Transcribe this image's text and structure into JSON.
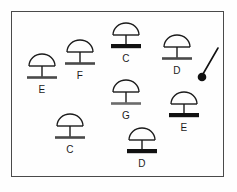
{
  "diagram": {
    "background_color": "#fefefe",
    "frame_color": "#4a4a4a",
    "stroke_color": "#1b1b1b",
    "frame": {
      "x": 11,
      "y": 11,
      "width": 213,
      "height": 166
    },
    "symbols": [
      {
        "id": "symbol-e-left",
        "label": "E",
        "x": 20,
        "y": 50,
        "base_weight": "medium",
        "base_color": "#4a4a4a",
        "label_x": 20,
        "label_y": 84
      },
      {
        "id": "symbol-f",
        "label": "F",
        "x": 58,
        "y": 36,
        "base_weight": "medium",
        "base_color": "#4a4a4a",
        "label_x": 58,
        "label_y": 70
      },
      {
        "id": "symbol-c-top",
        "label": "C",
        "x": 104,
        "y": 19,
        "base_weight": "thick",
        "base_color": "#111111",
        "label_x": 104,
        "label_y": 53
      },
      {
        "id": "symbol-d-right",
        "label": "D",
        "x": 155,
        "y": 31,
        "base_weight": "medium",
        "base_color": "#4a4a4a",
        "label_x": 155,
        "label_y": 65
      },
      {
        "id": "symbol-g",
        "label": "G",
        "x": 104,
        "y": 76,
        "base_weight": "medium",
        "base_color": "#6b6b6b",
        "label_x": 104,
        "label_y": 110
      },
      {
        "id": "symbol-e-right",
        "label": "E",
        "x": 162,
        "y": 88,
        "base_weight": "thick",
        "base_color": "#111111",
        "label_x": 162,
        "label_y": 122
      },
      {
        "id": "symbol-c-bottom",
        "label": "C",
        "x": 48,
        "y": 110,
        "base_weight": "medium",
        "base_color": "#4a4a4a",
        "label_x": 48,
        "label_y": 144
      },
      {
        "id": "symbol-d-bottom",
        "label": "D",
        "x": 120,
        "y": 124,
        "base_weight": "thick",
        "base_color": "#111111",
        "label_x": 120,
        "label_y": 158
      }
    ],
    "pin_marker": {
      "id": "pin-marker",
      "x": 196,
      "y": 46,
      "line_from": [
        22,
        2
      ],
      "line_to": [
        6,
        28
      ],
      "dot_center": [
        6,
        31
      ],
      "dot_radius": 4.5,
      "color": "#111111"
    }
  }
}
